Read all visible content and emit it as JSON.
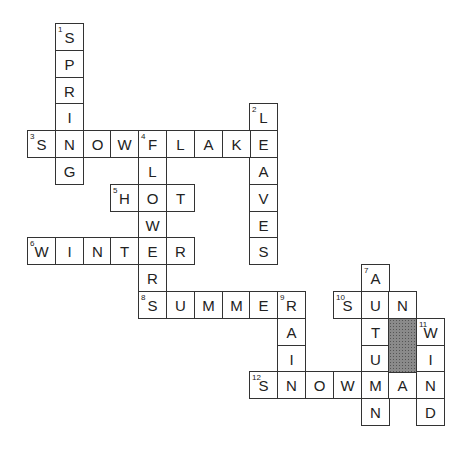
{
  "puzzle": {
    "grid": {
      "origin_x": 27,
      "origin_y": 23,
      "cell_w": 27.8,
      "cell_h": 26.8,
      "shaded": [
        {
          "col": 13,
          "row": 11,
          "rows": 2
        }
      ]
    },
    "words": [
      {
        "num": 1,
        "dir": "down",
        "answer": "SPRING",
        "col": 1,
        "row": 0
      },
      {
        "num": 2,
        "dir": "down",
        "answer": "LEAVES",
        "col": 8,
        "row": 3
      },
      {
        "num": 3,
        "dir": "across",
        "answer": "SNOWFLAKE",
        "col": 0,
        "row": 4
      },
      {
        "num": 4,
        "dir": "down",
        "answer": "FLOWER",
        "col": 4,
        "row": 4
      },
      {
        "num": 5,
        "dir": "across",
        "answer": "HOT",
        "col": 3,
        "row": 6
      },
      {
        "num": 6,
        "dir": "across",
        "answer": "WINTER",
        "col": 0,
        "row": 8
      },
      {
        "num": 7,
        "dir": "down",
        "answer": "AUTUMN",
        "col": 12,
        "row": 9
      },
      {
        "num": 8,
        "dir": "across",
        "answer": "SUMMER",
        "col": 4,
        "row": 10
      },
      {
        "num": 9,
        "dir": "down",
        "answer": "RAIN",
        "col": 9,
        "row": 10
      },
      {
        "num": 10,
        "dir": "across",
        "answer": "SUN",
        "col": 11,
        "row": 10
      },
      {
        "num": 11,
        "dir": "down",
        "answer": "WIND",
        "col": 14,
        "row": 11
      },
      {
        "num": 12,
        "dir": "across",
        "answer": "SNOWMAN",
        "col": 8,
        "row": 13
      }
    ]
  }
}
